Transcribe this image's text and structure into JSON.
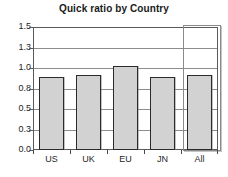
{
  "chart_data": {
    "type": "bar",
    "title": "Quick ratio by Country",
    "xlabel": "",
    "ylabel": "",
    "categories": [
      "US",
      "UK",
      "EU",
      "JN",
      "All"
    ],
    "values": [
      0.89,
      0.91,
      1.03,
      0.89,
      0.92
    ],
    "ylim": [
      0.0,
      1.5
    ],
    "ytick_labels": [
      "1.5",
      "1.3",
      "1.0",
      "0.8",
      "0.5",
      "0.3",
      "0.0"
    ],
    "ytick_values": [
      1.5,
      1.25,
      1.0,
      0.75,
      0.5,
      0.25,
      0.0
    ],
    "grid": true,
    "legend": "none",
    "bar_fill_color": "#d2d2d2",
    "bar_border_color": "#2b2b2b",
    "frame_color": "#5a5a5a",
    "gridline_color": "#8d8d8d",
    "highlight": {
      "category": "All",
      "label": "All",
      "border_color": "#8a8a8a"
    }
  }
}
